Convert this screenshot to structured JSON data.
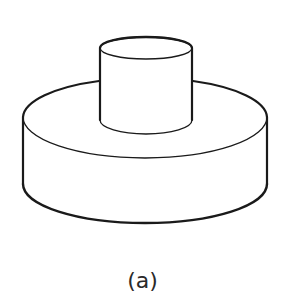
{
  "figure": {
    "caption": "(a)",
    "stroke_color": "#1a1a1a",
    "background": "#ffffff"
  }
}
